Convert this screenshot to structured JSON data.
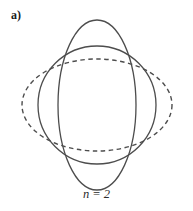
{
  "figure": {
    "panel_label": "a)",
    "caption": "n = 2",
    "width": 193,
    "height": 211,
    "background_color": "#ffffff",
    "stroke_color": "#4d4d4d",
    "label_color": "#1a1a1a"
  },
  "chart_data": {
    "type": "line",
    "title": "a)",
    "subtitle": "n = 2",
    "xlabel": "",
    "ylabel": "",
    "grid": false,
    "legend_position": "none",
    "annotations": [
      "a)",
      "n = 2"
    ],
    "center": {
      "x": 97,
      "y": 105
    },
    "xlim": [
      0,
      193
    ],
    "ylim": [
      0,
      211
    ],
    "series": [
      {
        "name": "vertical-ellipse",
        "shape": "ellipse",
        "style": "solid",
        "cx": 97,
        "cy": 105,
        "rx": 39,
        "ry": 85,
        "stroke": "#4d4d4d",
        "stroke_width": 1.3
      },
      {
        "name": "circle",
        "shape": "circle",
        "style": "solid",
        "cx": 97,
        "cy": 105,
        "rx": 59,
        "ry": 59,
        "stroke": "#4d4d4d",
        "stroke_width": 1.3
      },
      {
        "name": "horizontal-ellipse",
        "shape": "ellipse",
        "style": "dashed",
        "cx": 97,
        "cy": 105,
        "rx": 75,
        "ry": 46,
        "stroke": "#4d4d4d",
        "stroke_width": 1.4,
        "dash_pattern": "4.5 3.5"
      }
    ],
    "intersection_points": [
      {
        "x": 58,
        "y": 59
      },
      {
        "x": 136,
        "y": 59
      },
      {
        "x": 136,
        "y": 151
      },
      {
        "x": 58,
        "y": 151
      }
    ]
  }
}
